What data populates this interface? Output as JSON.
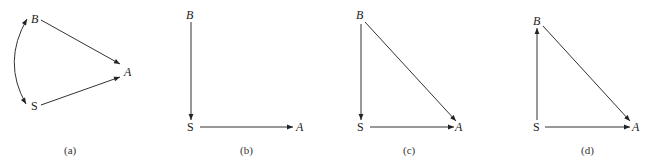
{
  "figure": {
    "panels": [
      {
        "caption": "(a)",
        "nodes": {
          "B": "B",
          "S": "S",
          "A": "A"
        },
        "edges": [
          "B→A",
          "S→A",
          "B↔S (curved, bidirected)"
        ]
      },
      {
        "caption": "(b)",
        "nodes": {
          "B": "B",
          "S": "S",
          "A": "A"
        },
        "edges": [
          "B→S",
          "S→A"
        ]
      },
      {
        "caption": "(c)",
        "nodes": {
          "B": "B",
          "S": "S",
          "A": "A"
        },
        "edges": [
          "B→S",
          "S→A",
          "B→A"
        ]
      },
      {
        "caption": "(d)",
        "nodes": {
          "B": "B",
          "S": "S",
          "A": "A"
        },
        "edges": [
          "S→B",
          "S→A",
          "B→A"
        ]
      }
    ],
    "colors": {
      "ink": "#333333",
      "background": "#ffffff"
    }
  }
}
